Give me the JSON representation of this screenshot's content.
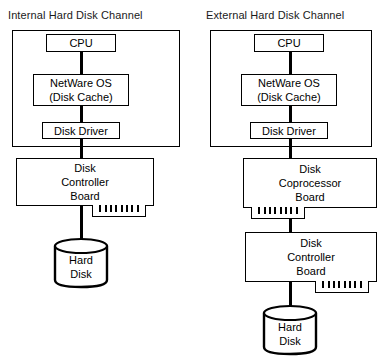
{
  "figure": {
    "type": "diagram",
    "columns": [
      {
        "title": "Internal Hard Disk Channel",
        "host": {
          "nodes": [
            {
              "label": "CPU"
            },
            {
              "label_line1": "NetWare OS",
              "label_line2": "(Disk Cache)"
            },
            {
              "label": "Disk Driver"
            }
          ]
        },
        "boards": [
          {
            "label_line1": "Disk",
            "label_line2": "Controller",
            "label_line3": "Board",
            "connector_side": "right",
            "connector_teeth": 8
          }
        ],
        "storage": {
          "label_line1": "Hard",
          "label_line2": "Disk"
        }
      },
      {
        "title": "External Hard Disk Channel",
        "host": {
          "nodes": [
            {
              "label": "CPU"
            },
            {
              "label_line1": "NetWare OS",
              "label_line2": "(Disk Cache)"
            },
            {
              "label": "Disk Driver"
            }
          ]
        },
        "boards": [
          {
            "label_line1": "Disk",
            "label_line2": "Coprocessor",
            "label_line3": "Board",
            "connector_side": "left",
            "connector_teeth": 8
          },
          {
            "label_line1": "Disk",
            "label_line2": "Controller",
            "label_line3": "Board",
            "connector_side": "right",
            "connector_teeth": 8
          }
        ],
        "storage": {
          "label_line1": "Hard",
          "label_line2": "Disk"
        }
      }
    ],
    "colors": {
      "stroke": "#000000",
      "fill": "#ffffff",
      "background": "#ffffff"
    }
  }
}
